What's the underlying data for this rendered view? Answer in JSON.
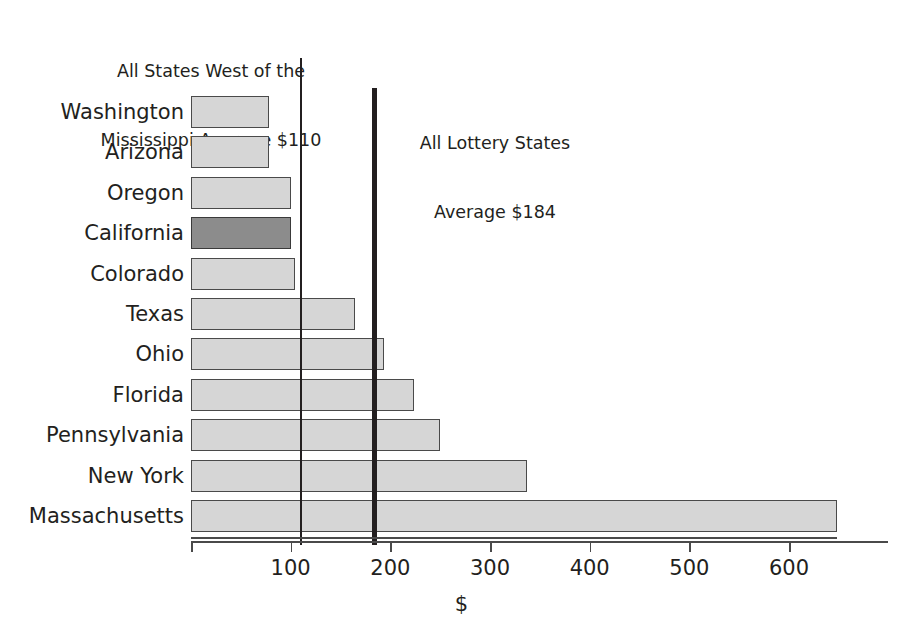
{
  "chart_data": {
    "type": "bar",
    "orientation": "horizontal",
    "title": "",
    "xlabel": "$",
    "ylabel": "",
    "xlim": [
      0,
      660
    ],
    "grid": false,
    "legend": null,
    "categories": [
      "Washington",
      "Arizona",
      "Oregon",
      "California",
      "Colorado",
      "Texas",
      "Ohio",
      "Florida",
      "Pennsylvania",
      "New York",
      "Massachusetts"
    ],
    "values": [
      78,
      78,
      100,
      100,
      104,
      165,
      194,
      224,
      250,
      337,
      648
    ],
    "highlighted_category": "California",
    "tick_values": [
      100,
      200,
      300,
      400,
      500,
      600
    ],
    "tick_labels": [
      "100",
      "200",
      "300",
      "400",
      "500",
      "600"
    ],
    "annotations": [
      {
        "name": "west-of-mississippi-average",
        "line1": "All States West of the",
        "line2": "Mississippi Average $110",
        "value": 110
      },
      {
        "name": "all-lottery-states-average",
        "line1": "All Lottery States",
        "line2": "Average $184",
        "value": 184
      }
    ],
    "colors": {
      "bar_fill": "#d6d6d6",
      "bar_stroke": "#4a4a4a",
      "highlight_fill": "#8c8c8c",
      "reference_line": "#231f20",
      "text": "#231f20",
      "background": "#ffffff"
    }
  }
}
